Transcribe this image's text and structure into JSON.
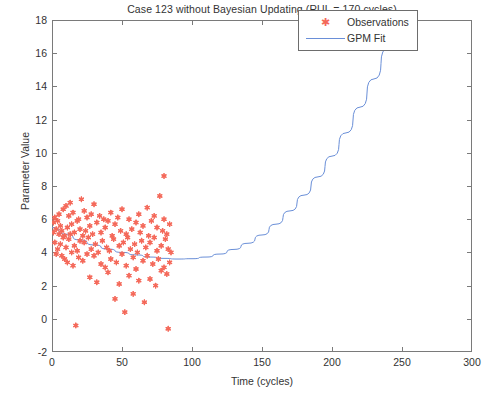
{
  "chart_data": {
    "type": "scatter",
    "title": "Case 123 without Bayesian Updating (RUL = 170 cycles)",
    "xlabel": "Time (cycles)",
    "ylabel": "Parameter Value",
    "xlim": [
      0,
      300
    ],
    "ylim": [
      -2,
      18
    ],
    "xticks": [
      0,
      50,
      100,
      150,
      200,
      250,
      300
    ],
    "yticks": [
      -2,
      0,
      2,
      4,
      6,
      8,
      10,
      12,
      14,
      16,
      18
    ],
    "grid": false,
    "legend_position": "top-right",
    "legend": [
      {
        "name": "Observations",
        "marker": "star",
        "color": "#f4695a"
      },
      {
        "name": "GPM Fit",
        "marker": "line",
        "color": "#6a8fd8"
      }
    ],
    "series": [
      {
        "name": "Observations",
        "type": "scatter",
        "color": "#f4695a",
        "points": [
          [
            1,
            5.8
          ],
          [
            1,
            5.2
          ],
          [
            2,
            4.6
          ],
          [
            2,
            6.1
          ],
          [
            3,
            5.4
          ],
          [
            3,
            3.9
          ],
          [
            4,
            5.9
          ],
          [
            4,
            4.2
          ],
          [
            5,
            5.1
          ],
          [
            5,
            6.3
          ],
          [
            6,
            4.5
          ],
          [
            6,
            5.6
          ],
          [
            7,
            3.8
          ],
          [
            7,
            5.3
          ],
          [
            8,
            6.6
          ],
          [
            8,
            4.9
          ],
          [
            9,
            5.0
          ],
          [
            9,
            3.6
          ],
          [
            10,
            6.8
          ],
          [
            10,
            4.3
          ],
          [
            11,
            5.5
          ],
          [
            11,
            3.4
          ],
          [
            12,
            6.2
          ],
          [
            12,
            4.8
          ],
          [
            13,
            7.0
          ],
          [
            13,
            5.1
          ],
          [
            14,
            4.0
          ],
          [
            14,
            5.7
          ],
          [
            15,
            6.4
          ],
          [
            15,
            3.2
          ],
          [
            16,
            5.2
          ],
          [
            16,
            4.4
          ],
          [
            17,
            -0.4
          ],
          [
            18,
            5.9
          ],
          [
            18,
            4.1
          ],
          [
            19,
            6.0
          ],
          [
            19,
            3.7
          ],
          [
            20,
            5.4
          ],
          [
            20,
            4.7
          ],
          [
            21,
            7.2
          ],
          [
            22,
            5.0
          ],
          [
            22,
            3.5
          ],
          [
            23,
            6.5
          ],
          [
            23,
            4.6
          ],
          [
            24,
            5.3
          ],
          [
            25,
            3.9
          ],
          [
            25,
            6.1
          ],
          [
            26,
            4.9
          ],
          [
            27,
            5.6
          ],
          [
            27,
            2.5
          ],
          [
            28,
            6.3
          ],
          [
            28,
            4.2
          ],
          [
            29,
            5.1
          ],
          [
            30,
            3.8
          ],
          [
            30,
            6.9
          ],
          [
            31,
            4.5
          ],
          [
            32,
            5.8
          ],
          [
            32,
            2.2
          ],
          [
            33,
            4.0
          ],
          [
            34,
            6.2
          ],
          [
            35,
            5.2
          ],
          [
            35,
            3.3
          ],
          [
            36,
            4.7
          ],
          [
            37,
            6.0
          ],
          [
            38,
            3.1
          ],
          [
            38,
            5.5
          ],
          [
            39,
            4.3
          ],
          [
            40,
            5.9
          ],
          [
            40,
            2.8
          ],
          [
            41,
            4.1
          ],
          [
            42,
            6.4
          ],
          [
            42,
            3.6
          ],
          [
            43,
            5.0
          ],
          [
            44,
            4.8
          ],
          [
            45,
            1.2
          ],
          [
            45,
            5.7
          ],
          [
            46,
            3.4
          ],
          [
            47,
            6.1
          ],
          [
            48,
            4.4
          ],
          [
            48,
            2.1
          ],
          [
            49,
            5.3
          ],
          [
            50,
            3.9
          ],
          [
            50,
            6.6
          ],
          [
            51,
            4.6
          ],
          [
            52,
            0.4
          ],
          [
            53,
            5.1
          ],
          [
            53,
            3.2
          ],
          [
            54,
            4.9
          ],
          [
            55,
            6.0
          ],
          [
            55,
            2.6
          ],
          [
            56,
            4.2
          ],
          [
            57,
            5.4
          ],
          [
            58,
            3.7
          ],
          [
            58,
            1.5
          ],
          [
            59,
            4.5
          ],
          [
            60,
            5.8
          ],
          [
            60,
            3.0
          ],
          [
            61,
            4.0
          ],
          [
            62,
            6.3
          ],
          [
            62,
            2.3
          ],
          [
            63,
            5.2
          ],
          [
            64,
            4.7
          ],
          [
            65,
            3.5
          ],
          [
            65,
            5.6
          ],
          [
            66,
            1.0
          ],
          [
            67,
            4.3
          ],
          [
            68,
            6.7
          ],
          [
            68,
            3.8
          ],
          [
            69,
            5.0
          ],
          [
            70,
            2.4
          ],
          [
            70,
            4.6
          ],
          [
            71,
            5.9
          ],
          [
            72,
            3.3
          ],
          [
            73,
            4.9
          ],
          [
            73,
            6.2
          ],
          [
            74,
            2.0
          ],
          [
            75,
            4.1
          ],
          [
            75,
            5.5
          ],
          [
            76,
            3.6
          ],
          [
            77,
            7.4
          ],
          [
            78,
            4.4
          ],
          [
            78,
            2.9
          ],
          [
            79,
            5.3
          ],
          [
            80,
            8.6
          ],
          [
            80,
            3.1
          ],
          [
            80,
            6.0
          ],
          [
            81,
            4.8
          ],
          [
            82,
            2.7
          ],
          [
            82,
            5.1
          ],
          [
            83,
            -0.6
          ],
          [
            83,
            4.2
          ],
          [
            84,
            3.4
          ],
          [
            84,
            5.7
          ],
          [
            85,
            4.0
          ]
        ]
      },
      {
        "name": "GPM Fit",
        "type": "line",
        "color": "#6a8fd8",
        "description": "Quadratic-like fit decreasing from ~5.5 at t=0 to a minimum of ~3.6 near t=95, then rising steeply to ~18 at t=255",
        "points": [
          [
            0,
            5.5
          ],
          [
            10,
            5.1
          ],
          [
            20,
            4.75
          ],
          [
            30,
            4.45
          ],
          [
            40,
            4.2
          ],
          [
            50,
            4.0
          ],
          [
            60,
            3.85
          ],
          [
            70,
            3.72
          ],
          [
            80,
            3.64
          ],
          [
            90,
            3.6
          ],
          [
            100,
            3.62
          ],
          [
            110,
            3.72
          ],
          [
            120,
            3.9
          ],
          [
            130,
            4.18
          ],
          [
            140,
            4.55
          ],
          [
            150,
            5.05
          ],
          [
            160,
            5.7
          ],
          [
            170,
            6.5
          ],
          [
            180,
            7.45
          ],
          [
            190,
            8.55
          ],
          [
            200,
            9.8
          ],
          [
            210,
            11.2
          ],
          [
            220,
            12.75
          ],
          [
            230,
            14.45
          ],
          [
            240,
            16.3
          ],
          [
            250,
            18.0
          ],
          [
            253,
            18.0
          ]
        ]
      }
    ]
  }
}
